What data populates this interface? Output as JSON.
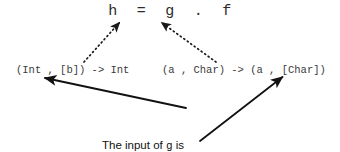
{
  "diagram": {
    "title_formula": "h  =  g  .  f",
    "signatures": {
      "left": "(Int , [b]) -> Int",
      "right": "(a , Char) -> (a , [Char])"
    },
    "caption": {
      "line1_pre": "The input of ",
      "line1_code": "g",
      "line1_post": " is",
      "line2_pre": "the output of ",
      "line2_code": "f",
      "line2_post": ""
    },
    "arrows": {
      "dotted_to_g": "dotted-arrow-to-g",
      "dotted_to_f": "dotted-arrow-to-f",
      "solid_to_left_sig": "solid-arrow-to-left-signature",
      "solid_to_right_sig": "solid-arrow-to-right-signature"
    },
    "colors": {
      "background": "#ffffff",
      "text": "#2b2b2b",
      "arrow": "#1a1a1a"
    }
  }
}
